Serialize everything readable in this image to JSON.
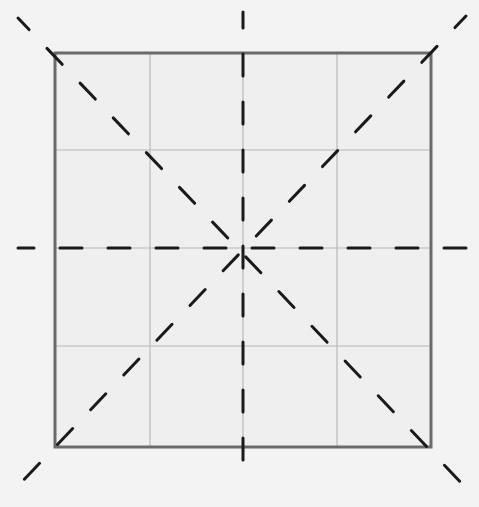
{
  "diagram": {
    "type": "square grid with dashed center and diagonal guide lines",
    "canvas": {
      "width": 479,
      "height": 507,
      "background": "#f3f3f3"
    },
    "frame": {
      "x1": 55,
      "y1": 53,
      "x2": 431,
      "y2": 447,
      "color": "#6a6a6a",
      "inner_fill": "#efefef"
    },
    "grid": {
      "rows": 4,
      "cols": 4,
      "vertical_lines": [
        150,
        243,
        337
      ],
      "horizontal_lines": [
        150,
        248,
        346
      ],
      "color": "#b8b8b8"
    },
    "center": {
      "x": 243,
      "y": 248
    },
    "dashed_lines": [
      {
        "name": "vertical-center-dashed",
        "x1": 243,
        "y1": 12,
        "x2": 243,
        "y2": 480
      },
      {
        "name": "horizontal-center-dashed",
        "x1": 18,
        "y1": 248,
        "x2": 468,
        "y2": 248
      },
      {
        "name": "diagonal-tl-br-dashed",
        "x1": 18,
        "y1": 18,
        "x2": 468,
        "y2": 490
      },
      {
        "name": "diagonal-tr-bl-dashed",
        "x1": 466,
        "y1": 16,
        "x2": 16,
        "y2": 488
      }
    ],
    "dash_color": "#1a1a1a"
  }
}
